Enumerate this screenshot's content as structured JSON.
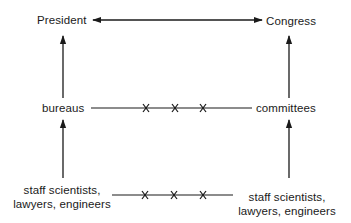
{
  "diagram": {
    "top": {
      "left_label": "President",
      "right_label": "Congress",
      "connector": "bidirectional-arrow"
    },
    "middle": {
      "left_label": "bureaus",
      "right_label": "committees",
      "connector": "line-with-three-x-marks"
    },
    "bottom": {
      "left_label_line1": "staff scientists,",
      "left_label_line2": "lawyers, engineers",
      "right_label_line1": "staff scientists,",
      "right_label_line2": "lawyers, engineers",
      "connector": "line-with-three-x-marks"
    },
    "vertical_arrows": [
      {
        "from": "bureaus",
        "to": "President"
      },
      {
        "from": "staff scientists, lawyers, engineers (left)",
        "to": "bureaus"
      },
      {
        "from": "committees",
        "to": "Congress"
      },
      {
        "from": "staff scientists, lawyers, engineers (right)",
        "to": "committees"
      }
    ],
    "colors": {
      "ink": "#1a1a1a",
      "background": "#ffffff"
    }
  }
}
